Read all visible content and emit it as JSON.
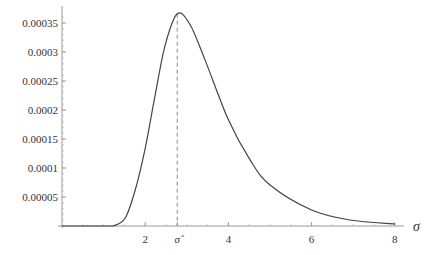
{
  "chart_data": {
    "type": "line",
    "title": "",
    "xlabel": "σ",
    "ylabel": "",
    "xlim": [
      0,
      8.1
    ],
    "ylim": [
      0,
      0.00037
    ],
    "grid": false,
    "legend": null,
    "x_ticks": [
      {
        "value": 2,
        "label": "2"
      },
      {
        "value": 2.77,
        "label": "σ̂"
      },
      {
        "value": 4,
        "label": "4"
      },
      {
        "value": 6,
        "label": "6"
      },
      {
        "value": 8,
        "label": "8"
      }
    ],
    "y_ticks": [
      {
        "value": 5e-05,
        "label": "0.00005"
      },
      {
        "value": 0.0001,
        "label": "0.0001"
      },
      {
        "value": 0.00015,
        "label": "0.00015"
      },
      {
        "value": 0.0002,
        "label": "0.0002"
      },
      {
        "value": 0.00025,
        "label": "0.00025"
      },
      {
        "value": 0.0003,
        "label": "0.0003"
      },
      {
        "value": 0.00035,
        "label": "0.00035"
      }
    ],
    "annotations": [
      {
        "type": "vertical-dashed-line",
        "x": 2.77,
        "label": "σ̂",
        "description": "mode of the curve"
      }
    ],
    "series": [
      {
        "name": "density",
        "x": [
          0,
          1.0,
          1.23,
          1.52,
          1.76,
          2.0,
          2.24,
          2.48,
          2.77,
          3.08,
          3.44,
          4.0,
          4.52,
          5.0,
          6.0,
          6.92,
          8.0
        ],
        "y": [
          0,
          0,
          0,
          1.38e-05,
          6.21e-05,
          0.000134,
          0.000226,
          0.000312,
          0.000366,
          0.000347,
          0.000286,
          0.000183,
          0.000114,
          7.07e-05,
          2.76e-05,
          1.03e-05,
          3.4e-06
        ]
      }
    ]
  }
}
